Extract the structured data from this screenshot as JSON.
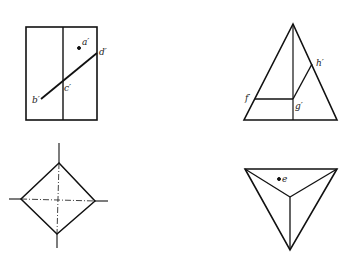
{
  "figure": {
    "views": [
      {
        "name": "front-view-prism",
        "labels": {
          "a": "a′",
          "b": "b′",
          "c": "c′",
          "d": "d′"
        }
      },
      {
        "name": "front-view-pyramid",
        "labels": {
          "f": "f′",
          "g": "g′",
          "h": "h′"
        }
      },
      {
        "name": "top-view-prism",
        "labels": {}
      },
      {
        "name": "top-view-pyramid",
        "labels": {
          "e": "e"
        }
      }
    ],
    "colors": {
      "line": "#111111",
      "background": "#ffffff"
    }
  }
}
